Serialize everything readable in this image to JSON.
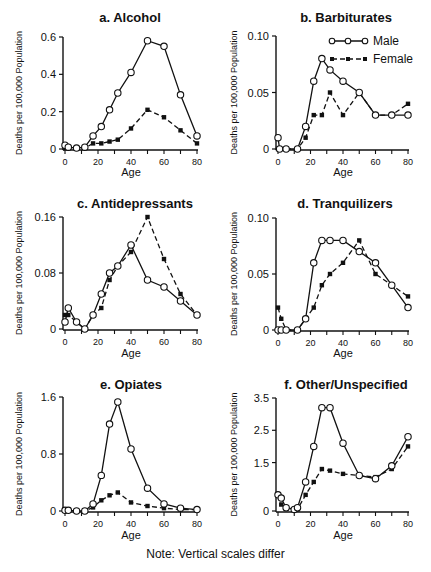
{
  "figure": {
    "note": "Note: Vertical scales differ",
    "y_axis_label": "Deaths per 100,000 Population",
    "x_axis_label": "Age",
    "legend": {
      "male": "Male",
      "female": "Female"
    }
  },
  "chart_data": [
    {
      "type": "line",
      "title": "a. Alcohol",
      "xlabel": "Age",
      "ylabel": "Deaths per 100,000 Population",
      "xlim": [
        0,
        80
      ],
      "ylim": [
        0,
        0.6
      ],
      "xticks": [
        0,
        20,
        40,
        60,
        80
      ],
      "yticks": [
        0,
        0.2,
        0.4,
        0.6
      ],
      "ytick_labels": [
        "0",
        "0.2",
        "0.4",
        "0.6"
      ],
      "series": [
        {
          "name": "Male",
          "style": "solid-open-circle",
          "x": [
            0,
            2,
            7,
            12,
            17,
            22,
            27,
            32,
            40,
            50,
            60,
            70,
            80
          ],
          "values": [
            0.02,
            0.01,
            0.005,
            0.01,
            0.07,
            0.12,
            0.21,
            0.3,
            0.41,
            0.58,
            0.55,
            0.29,
            0.07
          ]
        },
        {
          "name": "Female",
          "style": "dashed-filled-square",
          "x": [
            0,
            2,
            7,
            12,
            17,
            22,
            27,
            32,
            40,
            50,
            60,
            70,
            80
          ],
          "values": [
            0.005,
            0.005,
            0.005,
            0.005,
            0.03,
            0.03,
            0.04,
            0.05,
            0.11,
            0.21,
            0.17,
            0.1,
            0.03
          ]
        }
      ]
    },
    {
      "type": "line",
      "title": "b. Barbiturates",
      "xlabel": "Age",
      "ylabel": "Deaths per 100,000 Population",
      "xlim": [
        0,
        80
      ],
      "ylim": [
        0,
        0.1
      ],
      "xticks": [
        0,
        20,
        40,
        60,
        80
      ],
      "yticks": [
        0,
        0.05,
        0.1
      ],
      "ytick_labels": [
        "0",
        "0.05",
        "0.10"
      ],
      "legend_position": "upper right",
      "series": [
        {
          "name": "Male",
          "style": "solid-open-circle",
          "x": [
            0,
            1,
            5,
            12,
            17,
            22,
            27,
            32,
            40,
            50,
            60,
            70,
            80
          ],
          "values": [
            0.01,
            0.0,
            0.0,
            0.0,
            0.02,
            0.06,
            0.08,
            0.07,
            0.06,
            0.05,
            0.03,
            0.03,
            0.03
          ]
        },
        {
          "name": "Female",
          "style": "dashed-filled-square",
          "x": [
            0,
            1,
            5,
            12,
            17,
            22,
            27,
            32,
            40,
            50,
            60,
            70,
            80
          ],
          "values": [
            0.0,
            0.0,
            0.0,
            0.0,
            0.01,
            0.03,
            0.03,
            0.05,
            0.03,
            0.05,
            0.03,
            0.03,
            0.04
          ]
        }
      ]
    },
    {
      "type": "line",
      "title": "c. Antidepressants",
      "xlabel": "Age",
      "ylabel": "Deaths per 100,000 Population",
      "xlim": [
        0,
        80
      ],
      "ylim": [
        0,
        0.16
      ],
      "xticks": [
        0,
        20,
        40,
        60,
        80
      ],
      "yticks": [
        0,
        0.08,
        0.16
      ],
      "ytick_labels": [
        "0",
        "0.08",
        "0.16"
      ],
      "series": [
        {
          "name": "Male",
          "style": "solid-open-circle",
          "x": [
            0,
            2,
            7,
            12,
            17,
            22,
            27,
            32,
            40,
            50,
            60,
            70,
            80
          ],
          "values": [
            0.01,
            0.03,
            0.01,
            0.0,
            0.02,
            0.05,
            0.08,
            0.09,
            0.12,
            0.07,
            0.06,
            0.04,
            0.02
          ]
        },
        {
          "name": "Female",
          "style": "dashed-filled-square",
          "x": [
            0,
            2,
            7,
            12,
            17,
            22,
            27,
            32,
            40,
            50,
            60,
            70,
            80
          ],
          "values": [
            0.02,
            0.02,
            0.01,
            0.0,
            0.02,
            0.03,
            0.07,
            0.09,
            0.11,
            0.16,
            0.1,
            0.05,
            0.02
          ]
        }
      ]
    },
    {
      "type": "line",
      "title": "d. Tranquilizers",
      "xlabel": "Age",
      "ylabel": "Deaths per 100,000 Population",
      "xlim": [
        0,
        80
      ],
      "ylim": [
        0,
        0.1
      ],
      "xticks": [
        0,
        20,
        40,
        60,
        80
      ],
      "yticks": [
        0,
        0.05,
        0.1
      ],
      "ytick_labels": [
        "0",
        "0.05",
        "0.10"
      ],
      "series": [
        {
          "name": "Male",
          "style": "solid-open-circle",
          "x": [
            0,
            2,
            5,
            12,
            17,
            22,
            27,
            32,
            40,
            50,
            60,
            70,
            80
          ],
          "values": [
            0.0,
            0.0,
            0.0,
            0.0,
            0.01,
            0.06,
            0.08,
            0.08,
            0.08,
            0.07,
            0.06,
            0.04,
            0.02
          ]
        },
        {
          "name": "Female",
          "style": "dashed-filled-square",
          "x": [
            0,
            2,
            5,
            12,
            17,
            22,
            27,
            32,
            40,
            50,
            60,
            70,
            80
          ],
          "values": [
            0.02,
            0.01,
            0.0,
            0.0,
            0.01,
            0.02,
            0.04,
            0.05,
            0.06,
            0.08,
            0.05,
            0.04,
            0.03
          ]
        }
      ]
    },
    {
      "type": "line",
      "title": "e. Opiates",
      "xlabel": "Age",
      "ylabel": "Deaths per 100,000 Population",
      "xlim": [
        0,
        80
      ],
      "ylim": [
        0,
        1.6
      ],
      "xticks": [
        0,
        20,
        40,
        60,
        80
      ],
      "yticks": [
        0,
        0.8,
        1.6
      ],
      "ytick_labels": [
        "0",
        "0.8",
        "1.6"
      ],
      "series": [
        {
          "name": "Male",
          "style": "solid-open-circle",
          "x": [
            0,
            2,
            7,
            12,
            17,
            22,
            27,
            32,
            40,
            50,
            60,
            70,
            80
          ],
          "values": [
            0.01,
            0.01,
            0.0,
            0.0,
            0.1,
            0.5,
            1.22,
            1.53,
            0.87,
            0.32,
            0.1,
            0.04,
            0.02
          ]
        },
        {
          "name": "Female",
          "style": "dashed-filled-square",
          "x": [
            0,
            2,
            7,
            12,
            17,
            22,
            27,
            32,
            40,
            50,
            60,
            70,
            80
          ],
          "values": [
            0.01,
            0.01,
            0.0,
            0.0,
            0.05,
            0.15,
            0.22,
            0.26,
            0.12,
            0.07,
            0.04,
            0.02,
            0.02
          ]
        }
      ]
    },
    {
      "type": "line",
      "title": "f. Other/Unspecified",
      "xlabel": "Age",
      "ylabel": "Deaths per 100,000 Population",
      "xlim": [
        0,
        80
      ],
      "ylim": [
        0,
        3.5
      ],
      "xticks": [
        0,
        20,
        40,
        60,
        80
      ],
      "yticks": [
        0,
        1.5,
        2.5,
        3.5
      ],
      "ytick_labels": [
        "0",
        "1.5",
        "2.5",
        "3.5"
      ],
      "series": [
        {
          "name": "Male",
          "style": "solid-open-circle",
          "x": [
            0,
            2,
            5,
            10,
            12,
            17,
            22,
            27,
            32,
            40,
            50,
            60,
            70,
            80
          ],
          "values": [
            0.5,
            0.4,
            0.1,
            0.05,
            0.1,
            0.9,
            2.0,
            3.2,
            3.2,
            2.1,
            1.1,
            1.0,
            1.4,
            2.3
          ]
        },
        {
          "name": "Female",
          "style": "dashed-filled-square",
          "x": [
            0,
            2,
            5,
            10,
            12,
            17,
            22,
            27,
            32,
            40,
            50,
            60,
            70,
            80
          ],
          "values": [
            0.5,
            0.2,
            0.1,
            0.05,
            0.05,
            0.5,
            0.9,
            1.3,
            1.25,
            1.15,
            1.1,
            1.05,
            1.3,
            2.0
          ]
        }
      ]
    }
  ]
}
